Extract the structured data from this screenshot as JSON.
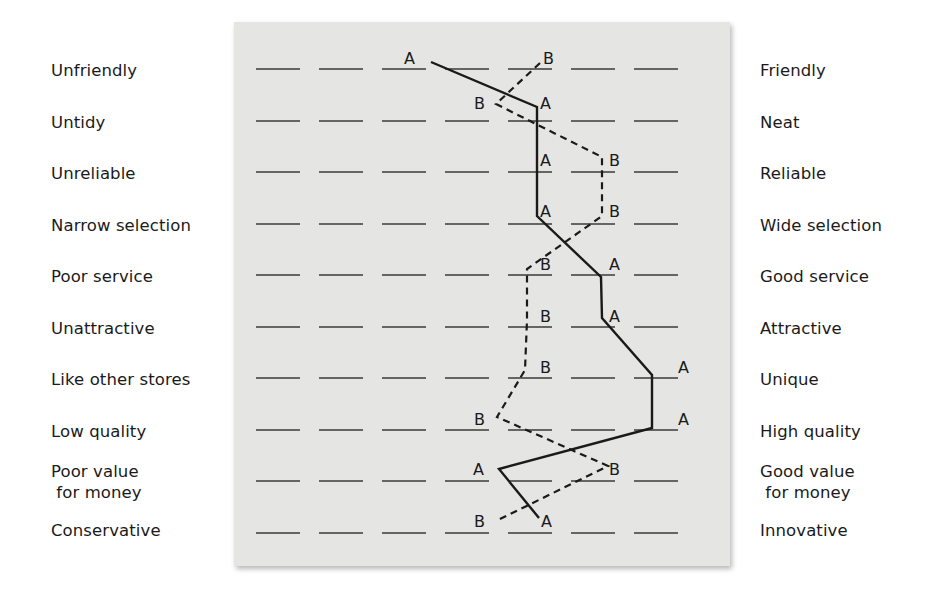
{
  "chart_data": {
    "type": "line",
    "title": "",
    "subtitle": "",
    "xlabel": "",
    "ylabel": "",
    "scale_points": 7,
    "xlim": [
      1,
      7
    ],
    "grid": false,
    "legend": "none (series identified by inline point labels A and B)",
    "categories_left": [
      "Unfriendly",
      "Untidy",
      "Unreliable",
      "Narrow selection",
      "Poor service",
      "Unattractive",
      "Like other stores",
      "Low quality",
      "Poor value\n for money",
      "Conservative"
    ],
    "categories_right": [
      "Friendly",
      "Neat",
      "Reliable",
      "Wide selection",
      "Good service",
      "Attractive",
      "Unique",
      "High quality",
      "Good value\n for money",
      "Innovative"
    ],
    "series": [
      {
        "name": "A",
        "style": "solid",
        "values": [
          3.4,
          5.1,
          5.1,
          5.1,
          6.1,
          6.1,
          6.9,
          6.9,
          4.5,
          5.1
        ]
      },
      {
        "name": "B",
        "style": "dashed",
        "values": [
          5.2,
          4.5,
          6.1,
          6.1,
          5.0,
          5.0,
          4.9,
          4.5,
          6.2,
          4.5
        ]
      }
    ]
  },
  "layout": {
    "row_y": [
      69,
      121,
      172,
      224,
      275,
      327,
      378,
      430,
      481,
      533
    ],
    "blank_x_start": [
      256,
      319,
      382,
      445,
      508,
      571,
      634
    ],
    "blank_width": 44,
    "left_label_y": [
      60,
      112,
      163,
      215,
      266,
      318,
      369,
      421,
      461,
      520
    ],
    "right_label_y": [
      60,
      112,
      163,
      215,
      266,
      318,
      369,
      421,
      461,
      520
    ],
    "series_A_points": [
      [
        431,
        62
      ],
      [
        537,
        107
      ],
      [
        537,
        158
      ],
      [
        537,
        216
      ],
      [
        601,
        277
      ],
      [
        602,
        318
      ],
      [
        652,
        375
      ],
      [
        652,
        428
      ],
      [
        499,
        469
      ],
      [
        539,
        518
      ]
    ],
    "series_B_points": [
      [
        540,
        63
      ],
      [
        496,
        104
      ],
      [
        602,
        157
      ],
      [
        602,
        216
      ],
      [
        527,
        269
      ],
      [
        527,
        320
      ],
      [
        525,
        370
      ],
      [
        497,
        417
      ],
      [
        608,
        466
      ],
      [
        496,
        521
      ]
    ],
    "A_label_pos": [
      [
        404,
        64
      ],
      [
        540,
        109
      ],
      [
        540,
        166
      ],
      [
        540,
        217
      ],
      [
        609,
        270
      ],
      [
        609,
        322
      ],
      [
        678,
        373
      ],
      [
        678,
        425
      ],
      [
        473,
        475
      ],
      [
        541,
        527
      ]
    ],
    "B_label_pos": [
      [
        543,
        64
      ],
      [
        474,
        109
      ],
      [
        609,
        166
      ],
      [
        609,
        217
      ],
      [
        540,
        270
      ],
      [
        540,
        322
      ],
      [
        540,
        373
      ],
      [
        474,
        425
      ],
      [
        609,
        475
      ],
      [
        474,
        527
      ]
    ],
    "colors": {
      "panel": "#e5e5e4",
      "ink": "#1a1a1a",
      "blank": "#3a3a3a"
    }
  }
}
